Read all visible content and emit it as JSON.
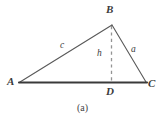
{
  "figure": {
    "caption": "(a)",
    "type": "triangle-with-altitude",
    "background_color": "#ffffff",
    "stroke_color_sides": "#555555",
    "stroke_color_base": "#3a3a3a",
    "stroke_color_dashed": "#8c8c8c",
    "label_color": "#3b3b3b"
  },
  "vertices": [
    {
      "name": "A",
      "label": "A",
      "x": 20,
      "y": 82
    },
    {
      "name": "B",
      "label": "B",
      "x": 112,
      "y": 25
    },
    {
      "name": "C",
      "label": "C",
      "x": 146,
      "y": 82
    },
    {
      "name": "D",
      "label": "D",
      "x": 111,
      "y": 82
    }
  ],
  "sides": [
    {
      "name": "AB",
      "label": "c",
      "from": "A",
      "to": "B"
    },
    {
      "name": "BC",
      "label": "a",
      "from": "B",
      "to": "C"
    },
    {
      "name": "AC",
      "label": "",
      "from": "A",
      "to": "C"
    }
  ],
  "altitude": {
    "label": "h",
    "from": "B",
    "to": "D",
    "style": "dashed"
  },
  "labels": {
    "vertex_a": "A",
    "vertex_b": "B",
    "vertex_c": "C",
    "vertex_d": "D",
    "side_c": "c",
    "side_a": "a",
    "height_h": "h"
  }
}
